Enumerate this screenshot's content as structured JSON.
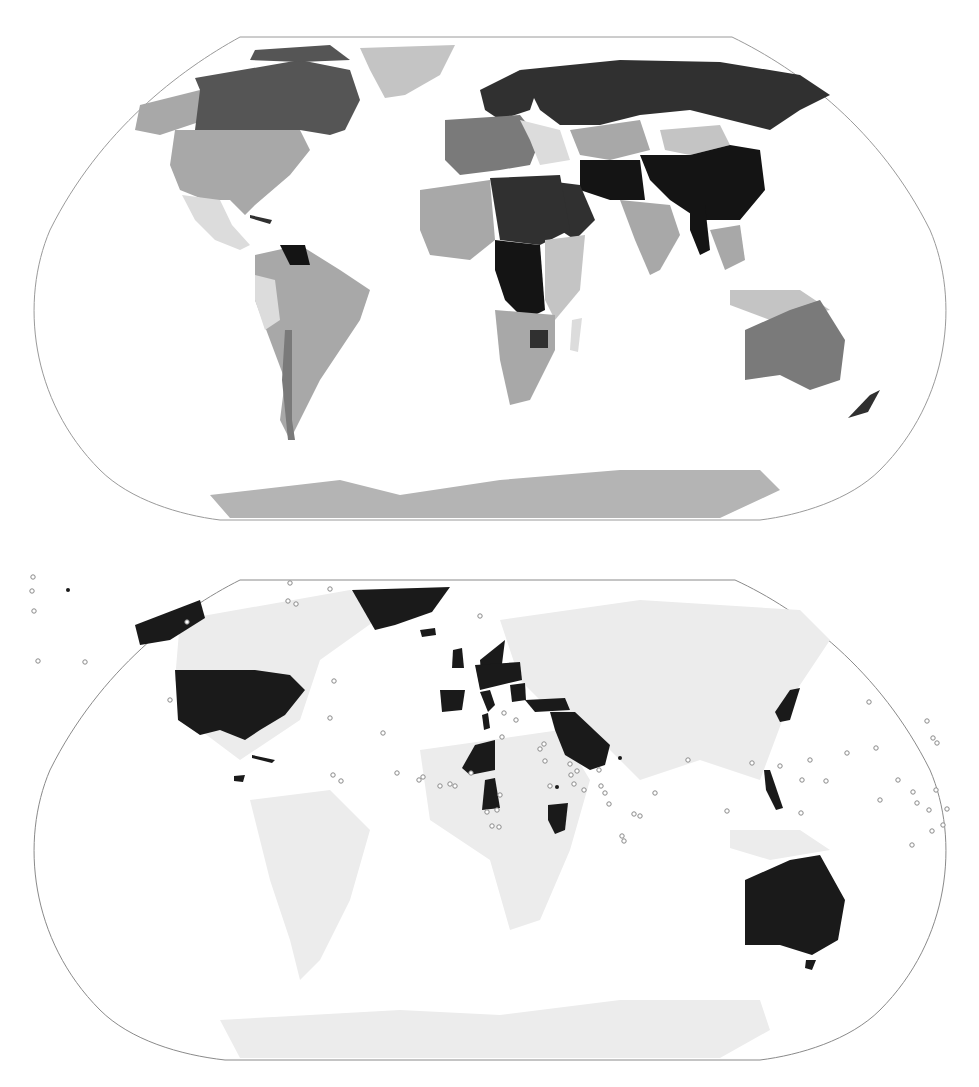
{
  "maps": [
    {
      "id": "choropleth",
      "projection": "robinson",
      "legend": null,
      "frame": {
        "stroke": "#9a9a9a"
      },
      "shades": {
        "darkest": "#141414",
        "dark": "#303030",
        "medium_dark": "#555555",
        "medium": "#7a7a7a",
        "light": "#a8a8a8",
        "lighter": "#c4c4c4",
        "lightest": "#dcdcdc",
        "antarctica": "#b4b4b4"
      },
      "regions": [
        {
          "name": "canada",
          "shade": "medium_dark"
        },
        {
          "name": "alaska",
          "shade": "light"
        },
        {
          "name": "usa",
          "shade": "light"
        },
        {
          "name": "mexico",
          "shade": "lightest"
        },
        {
          "name": "greenland",
          "shade": "lighter"
        },
        {
          "name": "south-america",
          "shade": "light"
        },
        {
          "name": "venezuela",
          "shade": "darkest"
        },
        {
          "name": "chile",
          "shade": "medium"
        },
        {
          "name": "europe-west",
          "shade": "medium"
        },
        {
          "name": "scandinavia",
          "shade": "dark"
        },
        {
          "name": "russia",
          "shade": "dark"
        },
        {
          "name": "kazakhstan",
          "shade": "light"
        },
        {
          "name": "mongolia",
          "shade": "lighter"
        },
        {
          "name": "china",
          "shade": "darkest"
        },
        {
          "name": "iran-afghanistan",
          "shade": "darkest"
        },
        {
          "name": "arabia",
          "shade": "dark"
        },
        {
          "name": "india",
          "shade": "light"
        },
        {
          "name": "myanmar",
          "shade": "darkest"
        },
        {
          "name": "southeast-asia",
          "shade": "lighter"
        },
        {
          "name": "north-africa-west",
          "shade": "light"
        },
        {
          "name": "libya-egypt-sudan",
          "shade": "dark"
        },
        {
          "name": "central-africa",
          "shade": "darkest"
        },
        {
          "name": "east-africa",
          "shade": "lighter"
        },
        {
          "name": "southern-africa",
          "shade": "light"
        },
        {
          "name": "zimbabwe",
          "shade": "dark"
        },
        {
          "name": "madagascar",
          "shade": "lightest"
        },
        {
          "name": "australia",
          "shade": "medium"
        },
        {
          "name": "new-zealand",
          "shade": "dark"
        },
        {
          "name": "antarctica",
          "shade": "antarctica"
        }
      ]
    },
    {
      "id": "highlight",
      "projection": "robinson",
      "legend": null,
      "frame": {
        "stroke": "#8a8a8a"
      },
      "colors": {
        "highlighted": "#1a1a1a",
        "base": "#ececec",
        "borders": "#ffffff",
        "marker_stroke": "#8a8a8a"
      },
      "highlighted_regions": [
        "alaska",
        "usa",
        "greenland",
        "iceland",
        "uk",
        "norway",
        "germany-poland",
        "spain",
        "italy",
        "balkans",
        "turkey-levant",
        "arabia",
        "oman",
        "niger",
        "cameroon",
        "kenya",
        "japan",
        "philippines",
        "australia",
        "tasmania",
        "cuba",
        "honduras"
      ],
      "markers": {
        "hollow": [
          [
            33,
            577
          ],
          [
            32,
            591
          ],
          [
            34,
            611
          ],
          [
            38,
            661
          ],
          [
            85,
            662
          ],
          [
            170,
            700
          ],
          [
            187,
            622
          ],
          [
            300,
            542
          ],
          [
            334,
            681
          ],
          [
            330,
            718
          ],
          [
            383,
            733
          ],
          [
            397,
            773
          ],
          [
            419,
            780
          ],
          [
            423,
            777
          ],
          [
            440,
            786
          ],
          [
            450,
            784
          ],
          [
            455,
            786
          ],
          [
            504,
            713
          ],
          [
            502,
            737
          ],
          [
            471,
            773
          ],
          [
            480,
            616
          ],
          [
            487,
            812
          ],
          [
            497,
            810
          ],
          [
            492,
            826
          ],
          [
            499,
            827
          ],
          [
            500,
            795
          ],
          [
            516,
            720
          ],
          [
            540,
            749
          ],
          [
            544,
            744
          ],
          [
            545,
            761
          ],
          [
            550,
            786
          ],
          [
            570,
            764
          ],
          [
            571,
            775
          ],
          [
            574,
            784
          ],
          [
            577,
            771
          ],
          [
            584,
            790
          ],
          [
            599,
            770
          ],
          [
            601,
            786
          ],
          [
            605,
            793
          ],
          [
            609,
            804
          ],
          [
            622,
            836
          ],
          [
            624,
            841
          ],
          [
            634,
            814
          ],
          [
            640,
            816
          ],
          [
            655,
            793
          ],
          [
            688,
            760
          ],
          [
            727,
            811
          ],
          [
            752,
            763
          ],
          [
            780,
            766
          ],
          [
            801,
            813
          ],
          [
            802,
            780
          ],
          [
            810,
            760
          ],
          [
            826,
            781
          ],
          [
            847,
            753
          ],
          [
            869,
            702
          ],
          [
            876,
            748
          ],
          [
            880,
            800
          ],
          [
            898,
            780
          ],
          [
            912,
            845
          ],
          [
            913,
            792
          ],
          [
            917,
            803
          ],
          [
            929,
            810
          ],
          [
            932,
            831
          ],
          [
            936,
            790
          ],
          [
            937,
            743
          ],
          [
            943,
            825
          ],
          [
            947,
            809
          ],
          [
            927,
            721
          ],
          [
            933,
            738
          ],
          [
            288,
            601
          ],
          [
            296,
            604
          ],
          [
            290,
            583
          ],
          [
            330,
            589
          ],
          [
            341,
            781
          ],
          [
            333,
            775
          ]
        ],
        "filled": [
          [
            68,
            590
          ],
          [
            620,
            758
          ],
          [
            557,
            787
          ]
        ]
      }
    }
  ]
}
